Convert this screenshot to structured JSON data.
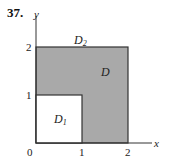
{
  "problem_number": "37.",
  "axes": {
    "x_label": "x",
    "y_label": "y",
    "origin_label": "0",
    "x_ticks": [
      "1",
      "2"
    ],
    "y_ticks": [
      "1",
      "2"
    ]
  },
  "regions": {
    "D": {
      "label": "D",
      "subscript": "",
      "description": "shaded L-shaped region [0,2]x[0,2] minus [0,1]x[0,1]"
    },
    "D1": {
      "label": "D",
      "subscript": "1",
      "description": "unshaded unit square [0,1]x[0,1]"
    },
    "D2": {
      "label": "D",
      "subscript": "2",
      "description": "full square [0,2]x[0,2]"
    }
  },
  "colors": {
    "shade": "#a9a9a9",
    "line": "#333333",
    "background": "#ffffff"
  }
}
